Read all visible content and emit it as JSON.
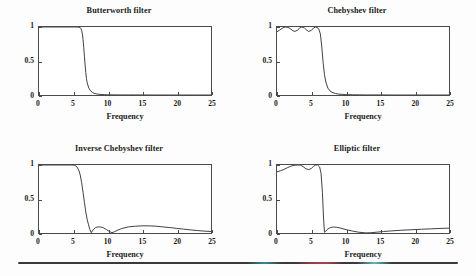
{
  "figure": {
    "background_color": "#fdfdfd",
    "axis_color": "#4a4a4a",
    "curve_color": "#2b2b2b",
    "text_color": "#1a1a1a",
    "rule_color": "#3a3a3a",
    "rule_fringe_cyan": "#5fb8bd",
    "rule_fringe_red": "#b04048"
  },
  "axis": {
    "xticks": [
      "0",
      "5",
      "10",
      "15",
      "20",
      "25"
    ],
    "xtick_values": [
      0,
      5,
      10,
      15,
      20,
      25
    ],
    "yticks": [
      "0",
      "0.5",
      "1"
    ],
    "ytick_values": [
      0,
      0.5,
      1
    ],
    "xlabel": "Frequency",
    "xlim": [
      0,
      25
    ],
    "ylim": [
      0,
      1
    ]
  },
  "panels": [
    {
      "title": "Butterworth filter"
    },
    {
      "title": "Chebyshev filter"
    },
    {
      "title": "Inverse Chebyshev filter"
    },
    {
      "title": "Elliptic filter"
    }
  ],
  "chart_data": [
    {
      "type": "line",
      "title": "Butterworth filter",
      "xlabel": "Frequency",
      "ylabel": "",
      "xlim": [
        0,
        25
      ],
      "ylim": [
        0,
        1
      ],
      "xticks": [
        0,
        5,
        10,
        15,
        20,
        25
      ],
      "yticks": [
        0,
        0.5,
        1
      ],
      "grid": false,
      "legend": "none",
      "x": [
        0,
        0.5,
        1,
        1.5,
        2,
        2.5,
        3,
        3.5,
        4,
        4.5,
        5,
        5.25,
        5.5,
        5.75,
        6,
        6.1,
        6.2,
        6.3,
        6.4,
        6.5,
        6.6,
        6.7,
        6.8,
        6.9,
        7,
        7.25,
        7.5,
        7.75,
        8,
        8.5,
        9,
        9.5,
        10,
        11,
        12,
        13,
        14,
        15,
        17,
        19,
        21,
        23,
        25
      ],
      "y": [
        1,
        1,
        1,
        1,
        1,
        1,
        1,
        1,
        1,
        1,
        1,
        1,
        0.999,
        0.998,
        0.99,
        0.975,
        0.95,
        0.9,
        0.82,
        0.7,
        0.57,
        0.44,
        0.33,
        0.24,
        0.18,
        0.1,
        0.06,
        0.04,
        0.025,
        0.013,
        0.008,
        0.005,
        0.003,
        0.002,
        0.001,
        0.001,
        0.001,
        0.001,
        0,
        0,
        0,
        0,
        0
      ]
    },
    {
      "type": "line",
      "title": "Chebyshev filter",
      "xlabel": "Frequency",
      "ylabel": "",
      "xlim": [
        0,
        25
      ],
      "ylim": [
        0,
        1
      ],
      "xticks": [
        0,
        5,
        10,
        15,
        20,
        25
      ],
      "yticks": [
        0,
        0.5,
        1
      ],
      "grid": false,
      "legend": "none",
      "passband_ripple_min": 0.93,
      "passband_ripple_max": 1,
      "cutoff": 6.3,
      "x": [
        0,
        0.4,
        0.8,
        1.2,
        1.6,
        2,
        2.3,
        2.6,
        3,
        3.3,
        3.6,
        4,
        4.3,
        4.6,
        5,
        5.3,
        5.6,
        5.9,
        6.1,
        6.3,
        6.5,
        6.7,
        6.9,
        7.1,
        7.4,
        7.7,
        8,
        8.5,
        9,
        9.5,
        10,
        11,
        12,
        13,
        15,
        17,
        19,
        21,
        23,
        25
      ],
      "y": [
        0.93,
        0.955,
        0.985,
        1,
        0.995,
        0.97,
        0.945,
        0.935,
        0.955,
        0.985,
        1,
        0.985,
        0.955,
        0.935,
        0.95,
        0.985,
        1,
        0.99,
        0.96,
        0.9,
        0.72,
        0.48,
        0.3,
        0.19,
        0.1,
        0.06,
        0.04,
        0.022,
        0.013,
        0.009,
        0.006,
        0.003,
        0.002,
        0.001,
        0.001,
        0,
        0,
        0,
        0,
        0
      ]
    },
    {
      "type": "line",
      "title": "Inverse Chebyshev filter",
      "xlabel": "Frequency",
      "ylabel": "",
      "xlim": [
        0,
        25
      ],
      "ylim": [
        0,
        1
      ],
      "xticks": [
        0,
        5,
        10,
        15,
        20,
        25
      ],
      "yticks": [
        0,
        0.5,
        1
      ],
      "grid": false,
      "legend": "none",
      "stopband_nulls": [
        7.6,
        10.6
      ],
      "stopband_lobe_peaks": [
        0.09,
        0.11
      ],
      "x": [
        0,
        1,
        2,
        3,
        4,
        4.8,
        5.2,
        5.5,
        5.8,
        6,
        6.2,
        6.4,
        6.6,
        6.8,
        7,
        7.2,
        7.4,
        7.6,
        7.9,
        8.2,
        8.6,
        9,
        9.4,
        9.8,
        10.2,
        10.6,
        11,
        11.5,
        12,
        13,
        14,
        15,
        16,
        17,
        18,
        19,
        20,
        21,
        22,
        23,
        24,
        25
      ],
      "y": [
        1,
        1,
        1,
        1,
        1,
        1,
        0.995,
        0.975,
        0.92,
        0.85,
        0.74,
        0.6,
        0.45,
        0.31,
        0.2,
        0.12,
        0.05,
        0.005,
        0.05,
        0.08,
        0.09,
        0.088,
        0.075,
        0.05,
        0.025,
        0.004,
        0.02,
        0.045,
        0.065,
        0.09,
        0.1,
        0.105,
        0.105,
        0.1,
        0.09,
        0.08,
        0.068,
        0.057,
        0.046,
        0.036,
        0.028,
        0.022
      ]
    },
    {
      "type": "line",
      "title": "Elliptic filter",
      "xlabel": "Frequency",
      "ylabel": "",
      "xlim": [
        0,
        25
      ],
      "ylim": [
        0,
        1
      ],
      "xticks": [
        0,
        5,
        10,
        15,
        20,
        25
      ],
      "yticks": [
        0,
        0.5,
        1
      ],
      "grid": false,
      "legend": "none",
      "passband_ripple_min": 0.9,
      "cutoff": 6.6,
      "stopband_null": 6.9,
      "x": [
        0,
        0.5,
        1,
        1.5,
        2,
        2.5,
        3,
        3.4,
        3.8,
        4.2,
        4.6,
        5,
        5.3,
        5.6,
        5.9,
        6.2,
        6.4,
        6.6,
        6.75,
        6.9,
        7.1,
        7.4,
        7.8,
        8.2,
        8.6,
        9,
        9.6,
        10.2,
        11,
        11.8,
        12.5,
        13,
        13.6,
        14.5,
        15.5,
        16.5,
        18,
        19.5,
        21,
        22.5,
        24,
        25
      ],
      "y": [
        0.9,
        0.915,
        0.935,
        0.96,
        0.982,
        0.996,
        1,
        0.998,
        0.975,
        0.945,
        0.932,
        0.95,
        0.98,
        0.998,
        1,
        0.97,
        0.88,
        0.6,
        0.25,
        0.01,
        0.03,
        0.06,
        0.082,
        0.088,
        0.085,
        0.078,
        0.062,
        0.046,
        0.028,
        0.013,
        0.005,
        0.002,
        0.004,
        0.012,
        0.022,
        0.03,
        0.04,
        0.048,
        0.055,
        0.062,
        0.068,
        0.072
      ]
    }
  ]
}
